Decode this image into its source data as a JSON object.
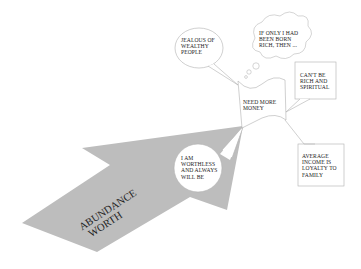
{
  "diagram": {
    "arrow": {
      "line1": "ABUNDANCE",
      "line2": "WORTH",
      "fill": "#bdbdbd"
    },
    "center": {
      "text_line1": "NEED MORE",
      "text_line2": "MONEY"
    },
    "bubbles": [
      {
        "id": "jealous",
        "shape": "speech-oval",
        "lines": [
          "JEALOUS OF",
          "WEALTHY",
          "PEOPLE"
        ]
      },
      {
        "id": "if-only",
        "shape": "thought-cloud",
        "lines": [
          "IF ONLY I HAD",
          "BEEN BORN",
          "RICH, THEN ..."
        ]
      },
      {
        "id": "cant-be",
        "shape": "rect-callout",
        "lines": [
          "CAN'T BE",
          "RICH AND",
          "SPIRITUAL"
        ]
      },
      {
        "id": "worthless",
        "shape": "speech-circle",
        "lines": [
          "I AM",
          "WORTHLESS",
          "AND ALWAYS",
          "WILL BE"
        ]
      },
      {
        "id": "average",
        "shape": "rect-callout",
        "lines": [
          "AVERAGE",
          "INCOME IS",
          "LOYALTY TO",
          "FAMILY"
        ]
      }
    ],
    "colors": {
      "line": "#9a9a9a",
      "text": "#222222",
      "arrow": "#bdbdbd",
      "background": "#ffffff"
    }
  }
}
